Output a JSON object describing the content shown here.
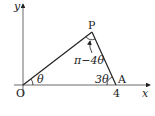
{
  "diagram": {
    "axes": {
      "x_label": "x",
      "y_label": "y",
      "origin_label": "O"
    },
    "points": {
      "P": "P",
      "A": "A"
    },
    "tick_A": "4",
    "angles": {
      "at_O": "θ",
      "at_P": "π−4θ",
      "at_A": "3θ"
    },
    "colors": {
      "line": "#222222",
      "background": "#ffffff"
    }
  }
}
